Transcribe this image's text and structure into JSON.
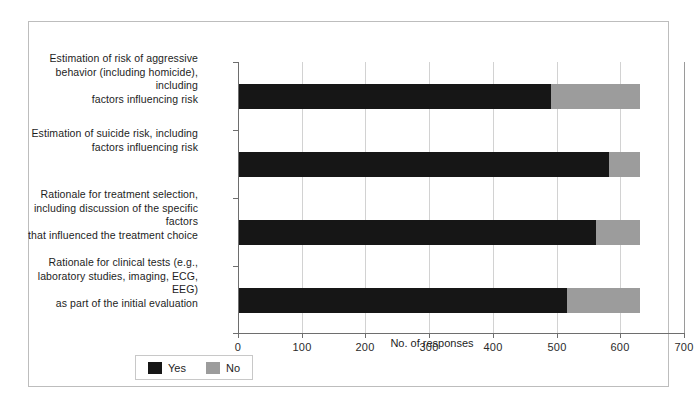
{
  "chart_data": {
    "type": "bar",
    "orientation": "horizontal",
    "stacked": true,
    "title": "",
    "xlabel": "No. of responses",
    "ylabel": "",
    "xlim": [
      0,
      700
    ],
    "xticks": [
      0,
      100,
      200,
      300,
      400,
      500,
      600,
      700
    ],
    "xticklabels": [
      "0",
      "100",
      "200",
      "300",
      "400",
      "500",
      "600",
      "700"
    ],
    "grid": "vertical",
    "legend_position": "below-left",
    "categories": [
      "Estimation of risk of aggressive behavior (including homicide), including factors influencing risk",
      "Estimation of suicide risk, including factors influencing risk",
      "Rationale for treatment selection, including discussion of the specific factors that influenced the treatment choice",
      "Rationale for clinical tests (e.g., laboratory studies, imaging, ECG, EEG) as part of the initial evaluation"
    ],
    "category_lines": [
      [
        "Estimation of risk of aggressive",
        "behavior (including homicide), including",
        "factors influencing risk"
      ],
      [
        "Estimation of suicide risk, including",
        "factors influencing risk"
      ],
      [
        "Rationale for treatment selection,",
        "including discussion of the specific factors",
        "that influenced the treatment choice"
      ],
      [
        "Rationale for clinical tests (e.g.,",
        "laboratory studies, imaging, ECG, EEG)",
        "as part of the initial evaluation"
      ]
    ],
    "series": [
      {
        "name": "Yes",
        "color": "#161616",
        "values": [
          490,
          580,
          560,
          515
        ]
      },
      {
        "name": "No",
        "color": "#9c9c9c",
        "values": [
          140,
          50,
          70,
          115
        ]
      }
    ],
    "totals": [
      630,
      630,
      630,
      630
    ]
  },
  "legend": {
    "items": [
      {
        "label": "Yes",
        "color": "#161616",
        "swatch": "legend-swatch-yes"
      },
      {
        "label": "No",
        "color": "#9c9c9c",
        "swatch": "legend-swatch-no"
      }
    ]
  },
  "colors": {
    "yes": "#161616",
    "no": "#9c9c9c",
    "frame": "#bdbdbd",
    "axis": "#6e6e6e",
    "grid": "#d2d2d2",
    "background": "#ffffff",
    "text": "#1d1d1d"
  }
}
